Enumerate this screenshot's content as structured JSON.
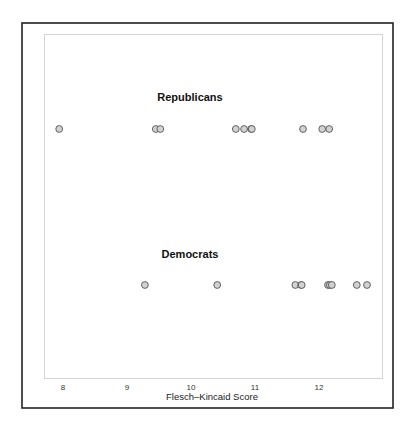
{
  "chart_data": {
    "type": "scatter",
    "title": "",
    "xlabel": "Flesch–Kincaid Score",
    "ylabel": "",
    "xlim": [
      7.9,
      12.95
    ],
    "x_ticks": [
      8,
      9,
      10,
      11,
      12
    ],
    "x_tick_labels": [
      "8",
      "9",
      "10",
      "11",
      "12"
    ],
    "grid": false,
    "legend": "none",
    "series": [
      {
        "name": "Republicans",
        "values": [
          7.94,
          9.45,
          9.52,
          10.7,
          10.83,
          10.94,
          10.95,
          11.75,
          12.05,
          12.16
        ]
      },
      {
        "name": "Democrats",
        "values": [
          9.28,
          10.41,
          11.63,
          11.72,
          11.73,
          12.14,
          12.17,
          12.2,
          12.59,
          12.75
        ]
      }
    ],
    "colors": {
      "point_fill": "#d2d2d2",
      "point_stroke": "#555555"
    }
  }
}
